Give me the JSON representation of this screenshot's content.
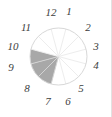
{
  "figure": {
    "name": "clock-face-pie-diagram",
    "canvas": {
      "width": 112,
      "height": 117
    },
    "background_color": "#ffffff",
    "border_color": "#e2e2e2"
  },
  "circle": {
    "center_x": 58.5,
    "center_y": 56.5,
    "radius": 28.5,
    "rim_color": "#d8d8d8",
    "rim_width": 1,
    "spoke_color": "#ededed",
    "spoke_width": 1,
    "sector_count": 12
  },
  "colors": {
    "shaded_fill": "#a8a8a8",
    "unshaded_fill": "#ffffff",
    "shaded_spoke": "#d4d4d4",
    "numeral": "#3d3d3d"
  },
  "chart_data": {
    "type": "pie",
    "title": "",
    "xlabel": "",
    "ylabel": "",
    "categories": [
      "12",
      "1",
      "2",
      "3",
      "4",
      "5",
      "6",
      "7",
      "8",
      "9",
      "10",
      "11"
    ],
    "values": [
      1,
      1,
      1,
      1,
      1,
      1,
      1,
      1,
      1,
      1,
      1,
      1
    ],
    "legend_position": "none",
    "grid": false,
    "slices": [
      {
        "label": "12",
        "hour": 12,
        "start_deg": 345,
        "end_deg": 15,
        "shaded": false,
        "fill": "#ffffff"
      },
      {
        "label": "1",
        "hour": 1,
        "start_deg": 15,
        "end_deg": 45,
        "shaded": false,
        "fill": "#ffffff"
      },
      {
        "label": "2",
        "hour": 2,
        "start_deg": 45,
        "end_deg": 75,
        "shaded": false,
        "fill": "#ffffff"
      },
      {
        "label": "3",
        "hour": 3,
        "start_deg": 75,
        "end_deg": 105,
        "shaded": false,
        "fill": "#ffffff"
      },
      {
        "label": "4",
        "hour": 4,
        "start_deg": 105,
        "end_deg": 135,
        "shaded": false,
        "fill": "#ffffff"
      },
      {
        "label": "5",
        "hour": 5,
        "start_deg": 135,
        "end_deg": 165,
        "shaded": false,
        "fill": "#ffffff"
      },
      {
        "label": "6",
        "hour": 6,
        "start_deg": 165,
        "end_deg": 195,
        "shaded": false,
        "fill": "#ffffff"
      },
      {
        "label": "7",
        "hour": 7,
        "start_deg": 195,
        "end_deg": 225,
        "shaded": true,
        "fill": "#a8a8a8"
      },
      {
        "label": "8",
        "hour": 8,
        "start_deg": 225,
        "end_deg": 255,
        "shaded": true,
        "fill": "#a8a8a8"
      },
      {
        "label": "9",
        "hour": 9,
        "start_deg": 255,
        "end_deg": 285,
        "shaded": true,
        "fill": "#a8a8a8"
      },
      {
        "label": "10",
        "hour": 10,
        "start_deg": 285,
        "end_deg": 315,
        "shaded": false,
        "fill": "#ffffff"
      },
      {
        "label": "11",
        "hour": 11,
        "start_deg": 315,
        "end_deg": 345,
        "shaded": false,
        "fill": "#ffffff"
      }
    ],
    "shaded_slices": [
      "7",
      "8",
      "9"
    ],
    "shaded_fraction": "3/12"
  },
  "hour_labels": [
    {
      "text": "12",
      "x": 51,
      "y": 12
    },
    {
      "text": "1",
      "x": 69,
      "y": 11
    },
    {
      "text": "2",
      "x": 88,
      "y": 27
    },
    {
      "text": "3",
      "x": 96,
      "y": 46
    },
    {
      "text": "4",
      "x": 96,
      "y": 65
    },
    {
      "text": "5",
      "x": 81,
      "y": 88
    },
    {
      "text": "6",
      "x": 68,
      "y": 101
    },
    {
      "text": "7",
      "x": 48,
      "y": 101
    },
    {
      "text": "8",
      "x": 27,
      "y": 88
    },
    {
      "text": "9",
      "x": 11,
      "y": 67
    },
    {
      "text": "10",
      "x": 13,
      "y": 46
    },
    {
      "text": "11",
      "x": 26,
      "y": 27
    }
  ]
}
